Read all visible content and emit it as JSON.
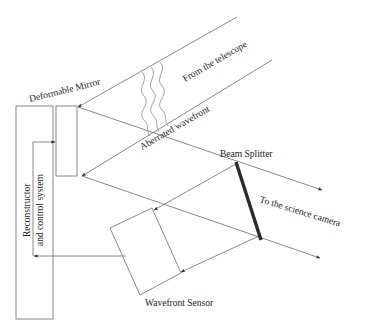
{
  "diagram": {
    "labels": {
      "deformable_mirror": "Deformable Mirror",
      "from_telescope": "From the telescope",
      "aberrated_wavefront": "Aberrated wavefront",
      "beam_splitter": "Beam Splitter",
      "science_camera": "To the science camera",
      "wavefront_sensor": "Wavefront Sensor",
      "reconstructor_line1": "Reconstructor",
      "reconstructor_line2": "and control system"
    },
    "components": [
      {
        "name": "Deformable Mirror",
        "shape": "rectangle"
      },
      {
        "name": "Beam Splitter",
        "shape": "thick-line"
      },
      {
        "name": "Wavefront Sensor",
        "shape": "rotated-rectangle"
      },
      {
        "name": "Reconstructor and control system",
        "shape": "tall-rectangle"
      }
    ],
    "colors": {
      "line": "#6a6a6a",
      "beam_splitter": "#2b2b2b",
      "text": "#222222",
      "background": "#ffffff"
    }
  }
}
